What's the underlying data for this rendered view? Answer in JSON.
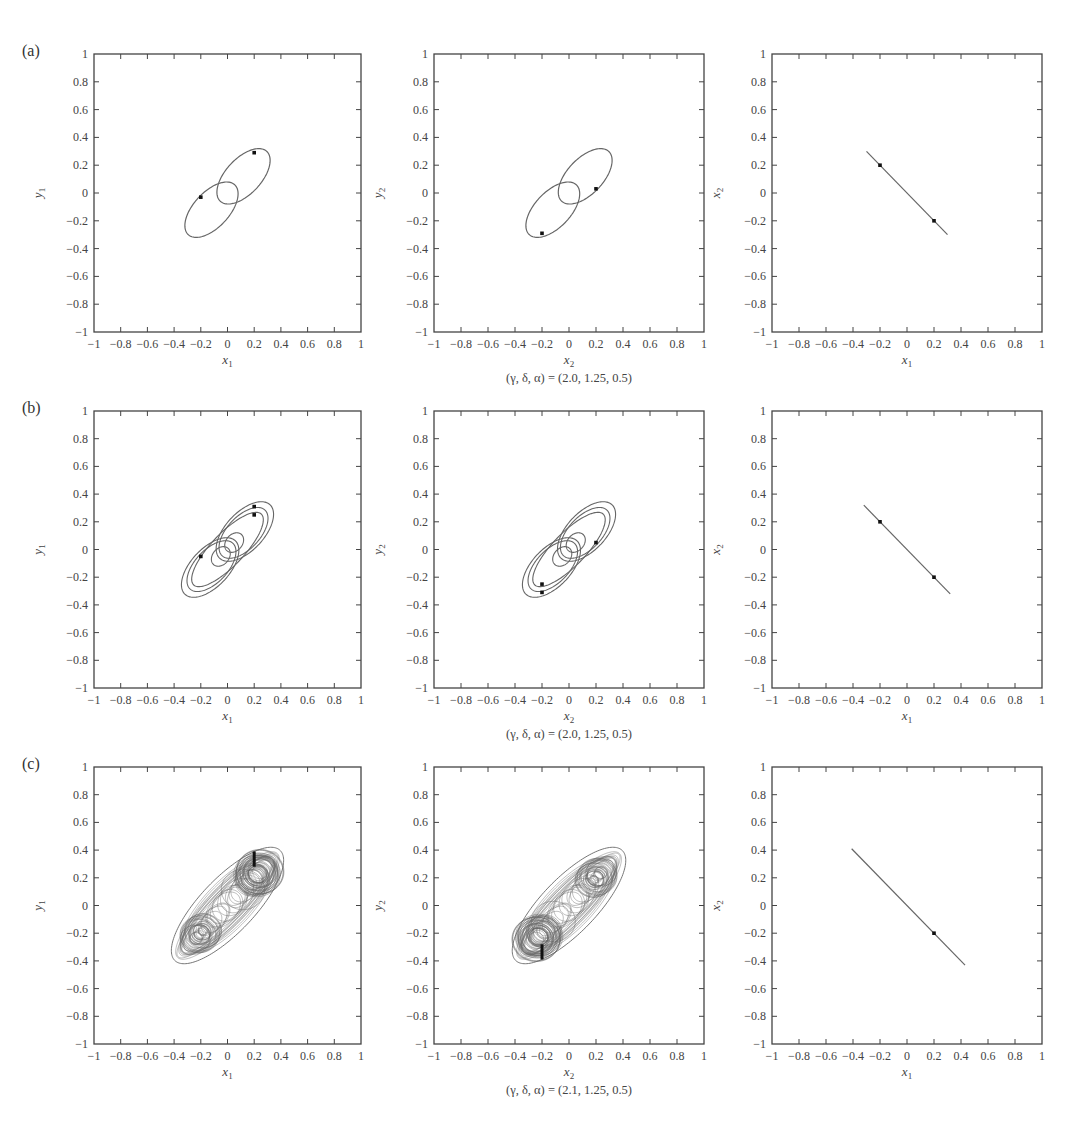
{
  "figure": {
    "panel_labels": [
      "(a)",
      "(b)",
      "(c)"
    ],
    "captions": [
      "(γ, δ, α) = (2.0, 1.25, 0.5)",
      "(γ, δ, α) = (2.0, 1.25, 0.5)",
      "(γ, δ, α) = (2.1, 1.25, 0.5)"
    ],
    "tick_values": [
      -1,
      -0.8,
      -0.6,
      -0.4,
      -0.2,
      0,
      0.2,
      0.4,
      0.6,
      0.8,
      1
    ],
    "tick_labels": [
      "−1",
      "−0.8",
      "−0.6",
      "−0.4",
      "−0.2",
      "0",
      "0.2",
      "0.4",
      "0.6",
      "0.8",
      "1"
    ],
    "colors": {
      "curve": "#666666",
      "axis": "#444444",
      "marker": "#111111"
    }
  },
  "chart_data": [
    {
      "type": "line",
      "row": "a",
      "col": 1,
      "title": "",
      "xlabel": "x1",
      "ylabel": "y1",
      "xlim": [
        -1,
        1
      ],
      "ylim": [
        -1,
        1
      ],
      "grid": false,
      "description": "Period-2 figure-eight orbit in (x1, y1) phase plane",
      "series": [
        {
          "name": "orbit",
          "shape": "figure-eight",
          "extent_x": [
            -0.3,
            0.3
          ],
          "extent_y": [
            -0.3,
            0.3
          ]
        }
      ],
      "markers": [
        [
          0.2,
          0.29
        ],
        [
          -0.2,
          -0.03
        ]
      ]
    },
    {
      "type": "line",
      "row": "a",
      "col": 2,
      "xlabel": "x2",
      "ylabel": "y2",
      "xlim": [
        -1,
        1
      ],
      "ylim": [
        -1,
        1
      ],
      "grid": false,
      "series": [
        {
          "name": "orbit",
          "shape": "figure-eight",
          "extent_x": [
            -0.3,
            0.3
          ],
          "extent_y": [
            -0.3,
            0.3
          ]
        }
      ],
      "markers": [
        [
          -0.2,
          -0.29
        ],
        [
          0.2,
          0.03
        ]
      ]
    },
    {
      "type": "line",
      "row": "a",
      "col": 3,
      "xlabel": "x1",
      "ylabel": "x2",
      "xlim": [
        -1,
        1
      ],
      "ylim": [
        -1,
        1
      ],
      "grid": false,
      "series": [
        {
          "name": "synchronization line",
          "x": [
            -0.3,
            0.3
          ],
          "y": [
            0.3,
            -0.3
          ]
        }
      ],
      "markers": [
        [
          -0.2,
          0.2
        ],
        [
          0.2,
          -0.2
        ]
      ]
    },
    {
      "type": "line",
      "row": "b",
      "col": 1,
      "xlabel": "x1",
      "ylabel": "y1",
      "xlim": [
        -1,
        1
      ],
      "ylim": [
        -1,
        1
      ],
      "grid": false,
      "series": [
        {
          "name": "orbit",
          "shape": "multi-loop figure-eight",
          "extent_x": [
            -0.32,
            0.32
          ],
          "extent_y": [
            -0.32,
            0.32
          ]
        }
      ],
      "markers": [
        [
          0.2,
          0.31
        ],
        [
          0.2,
          0.25
        ],
        [
          -0.2,
          -0.05
        ]
      ]
    },
    {
      "type": "line",
      "row": "b",
      "col": 2,
      "xlabel": "x2",
      "ylabel": "y2",
      "xlim": [
        -1,
        1
      ],
      "ylim": [
        -1,
        1
      ],
      "grid": false,
      "series": [
        {
          "name": "orbit",
          "shape": "multi-loop figure-eight",
          "extent_x": [
            -0.32,
            0.32
          ],
          "extent_y": [
            -0.32,
            0.32
          ]
        }
      ],
      "markers": [
        [
          -0.2,
          -0.31
        ],
        [
          -0.2,
          -0.25
        ],
        [
          0.2,
          0.05
        ]
      ]
    },
    {
      "type": "line",
      "row": "b",
      "col": 3,
      "xlabel": "x1",
      "ylabel": "x2",
      "xlim": [
        -1,
        1
      ],
      "ylim": [
        -1,
        1
      ],
      "grid": false,
      "series": [
        {
          "name": "synchronization line",
          "x": [
            -0.32,
            0.32
          ],
          "y": [
            0.32,
            -0.32
          ]
        }
      ],
      "markers": [
        [
          -0.2,
          0.2
        ],
        [
          0.2,
          -0.2
        ]
      ]
    },
    {
      "type": "line",
      "row": "c",
      "col": 1,
      "xlabel": "x1",
      "ylabel": "y1",
      "xlim": [
        -1,
        1
      ],
      "ylim": [
        -1,
        1
      ],
      "grid": false,
      "series": [
        {
          "name": "orbit",
          "shape": "chaotic double-scroll",
          "extent_x": [
            -0.4,
            0.42
          ],
          "extent_y": [
            -0.4,
            0.4
          ]
        }
      ],
      "markers": [
        [
          0.2,
          0.28
        ],
        [
          0.2,
          0.39
        ]
      ]
    },
    {
      "type": "line",
      "row": "c",
      "col": 2,
      "xlabel": "x2",
      "ylabel": "y2",
      "xlim": [
        -1,
        1
      ],
      "ylim": [
        -1,
        1
      ],
      "grid": false,
      "series": [
        {
          "name": "orbit",
          "shape": "chaotic double-scroll",
          "extent_x": [
            -0.42,
            0.4
          ],
          "extent_y": [
            -0.4,
            0.4
          ]
        }
      ],
      "markers": [
        [
          -0.2,
          -0.28
        ],
        [
          -0.2,
          -0.39
        ]
      ]
    },
    {
      "type": "line",
      "row": "c",
      "col": 3,
      "xlabel": "x1",
      "ylabel": "x2",
      "xlim": [
        -1,
        1
      ],
      "ylim": [
        -1,
        1
      ],
      "grid": false,
      "series": [
        {
          "name": "synchronization line",
          "x": [
            -0.41,
            0.43
          ],
          "y": [
            0.41,
            -0.43
          ]
        }
      ],
      "markers": [
        [
          0.2,
          -0.2
        ]
      ]
    }
  ]
}
